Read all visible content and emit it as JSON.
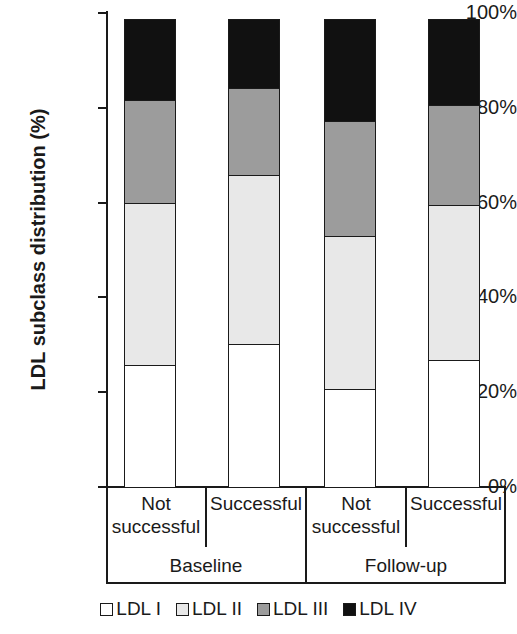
{
  "chart_data": {
    "type": "bar",
    "subtype": "stacked-100-percent",
    "title": "",
    "xlabel": "",
    "ylabel": "LDL subclass distribution (%)",
    "ylim": [
      0,
      100
    ],
    "ytick_labels": [
      "0%",
      "20%",
      "40%",
      "60%",
      "80%",
      "100%"
    ],
    "ytick_values": [
      0,
      20,
      40,
      60,
      80,
      100
    ],
    "grid": false,
    "legend_position": "bottom",
    "categories": [
      "Not successful",
      "Successful",
      "Not successful",
      "Successful"
    ],
    "group_labels": [
      "Baseline",
      "Follow-up"
    ],
    "groups": [
      {
        "label": "Baseline",
        "categories": [
          "Not successful",
          "Successful"
        ]
      },
      {
        "label": "Follow-up",
        "categories": [
          "Not successful",
          "Successful"
        ]
      }
    ],
    "series": [
      {
        "name": "LDL I",
        "color": "#ffffff",
        "values": [
          26.0,
          30.5,
          21.0,
          27.0
        ]
      },
      {
        "name": "LDL II",
        "color": "#e8e8e8",
        "values": [
          34.5,
          36.0,
          32.5,
          33.0
        ]
      },
      {
        "name": "LDL III",
        "color": "#9c9c9c",
        "values": [
          22.0,
          18.5,
          24.5,
          21.5
        ]
      },
      {
        "name": "LDL IV",
        "color": "#111111",
        "values": [
          17.5,
          15.0,
          22.0,
          18.5
        ]
      }
    ],
    "cumulative_tops": [
      [
        26.0,
        60.5,
        82.5,
        100.0
      ],
      [
        30.5,
        66.5,
        85.0,
        100.0
      ],
      [
        21.0,
        53.5,
        78.0,
        100.0
      ],
      [
        27.0,
        60.0,
        81.5,
        100.0
      ]
    ]
  },
  "legend": {
    "items": [
      {
        "label": "LDL I",
        "color": "#ffffff"
      },
      {
        "label": "LDL II",
        "color": "#e8e8e8"
      },
      {
        "label": "LDL III",
        "color": "#9c9c9c"
      },
      {
        "label": "LDL IV",
        "color": "#111111"
      }
    ]
  }
}
